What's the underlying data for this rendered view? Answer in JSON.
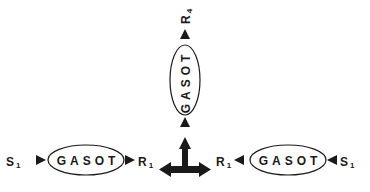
{
  "diagram": {
    "colors": {
      "stroke": "#1a1a1a",
      "fill": "#1a1a1a",
      "background": "#ffffff"
    },
    "left_chain": {
      "input_label": "S",
      "input_subscript": "1",
      "node_label": "GASOT",
      "output_label": "R",
      "output_subscript": "1"
    },
    "right_chain": {
      "input_label": "S",
      "input_subscript": "1",
      "node_label": "GASOT",
      "output_label": "R",
      "output_subscript": "1"
    },
    "vertical_chain": {
      "node_label": "GASOT",
      "output_label": "R",
      "output_subscript": "4"
    },
    "center_junction": {
      "icon": "three-way-arrow-icon"
    }
  }
}
